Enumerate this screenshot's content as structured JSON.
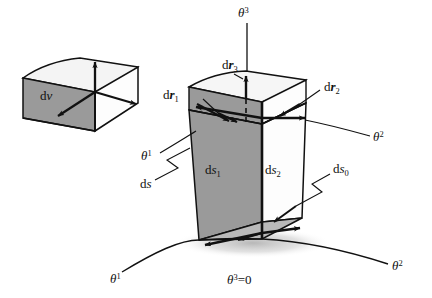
{
  "figure": {
    "background_color": "#ffffff",
    "line_color": "#111111",
    "shaded_face_color": "#9a9a9a",
    "light_face_color": "#f2f2f2",
    "shadow_color": "#c9c9c9"
  },
  "labels": {
    "dv": {
      "text": "d",
      "symbol": "v"
    },
    "dr1": {
      "text": "d",
      "symbol": "r",
      "sub": "1"
    },
    "dr2": {
      "text": "d",
      "symbol": "r",
      "sub": "2"
    },
    "dr3": {
      "text": "d",
      "symbol": "r",
      "sub": "3"
    },
    "ds": {
      "text": "d",
      "symbol": "s"
    },
    "ds0": {
      "text": "d",
      "symbol": "s",
      "sub": "0"
    },
    "ds1": {
      "text": "d",
      "symbol": "s",
      "sub": "1"
    },
    "ds2": {
      "text": "d",
      "symbol": "s",
      "sub": "2"
    },
    "theta1_upper": {
      "symbol": "θ",
      "sup": "1"
    },
    "theta1_lower": {
      "symbol": "θ",
      "sup": "1"
    },
    "theta2_upper": {
      "symbol": "θ",
      "sup": "2"
    },
    "theta2_lower": {
      "symbol": "θ",
      "sup": "2"
    },
    "theta3_axis": {
      "symbol": "θ",
      "sup": "3"
    },
    "theta3_zero": {
      "symbol": "θ",
      "sup": "3",
      "equals": "=0"
    }
  },
  "elements": {
    "volume_block_name": "dv parallelepiped",
    "surface_block_name": "ds curvilinear prism",
    "coordinate_surface": "theta3 = 0 surface"
  }
}
